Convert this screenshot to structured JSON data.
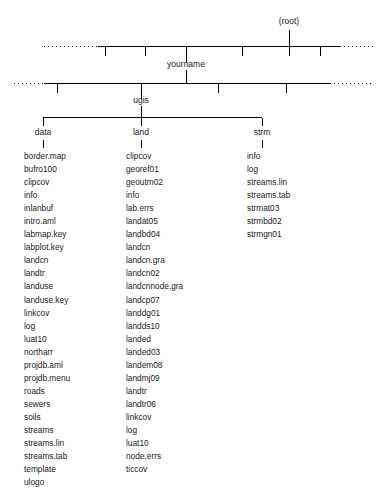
{
  "diagram": {
    "type": "directory-tree",
    "title_node": "(root)",
    "levels": [
      {
        "name": "root-level",
        "label": "(root)",
        "description": "top level bus with sibling ticks, dotted continuation at both ends"
      },
      {
        "name": "user-level",
        "label": "yourname",
        "description": "second level bus with sibling ticks, dotted continuation at both ends"
      },
      {
        "name": "project-level",
        "label": "ugis"
      }
    ],
    "root": {
      "label": "(root)"
    },
    "user": {
      "label": "yourname"
    },
    "project": {
      "label": "ugis"
    },
    "columns": [
      {
        "name": "data",
        "label": "data",
        "items": [
          "border.map",
          "bufro100",
          "clipcov",
          "info",
          "inlanbuf",
          "intro.aml",
          "labmap.key",
          "labplot.key",
          "landcn",
          "landtr",
          "landuse",
          "landuse.key",
          "linkcov",
          "log",
          "luat10",
          "northarr",
          "projdb.aml",
          "projdb.menu",
          "roads",
          "sewers",
          "soils",
          "streams",
          "streams.lin",
          "streams.tab",
          "template",
          "ulogo"
        ]
      },
      {
        "name": "land",
        "label": "land",
        "items": [
          "clipcov",
          "georef01",
          "geoutm02",
          "info",
          "lab.errs",
          "landat05",
          "landbd04",
          "landcn",
          "landcn.gra",
          "landcn02",
          "landcnnode.gra",
          "landcp07",
          "landdg01",
          "landds10",
          "landed",
          "landed03",
          "landem08",
          "landmj09",
          "landtr",
          "landtr06",
          "linkcov",
          "log",
          "luat10",
          "node.errs",
          "ticcov"
        ]
      },
      {
        "name": "strm",
        "label": "strm",
        "items": [
          "info",
          "log",
          "streams.lin",
          "streams.tab",
          "strmat03",
          "strmbd02",
          "strmgn01"
        ]
      }
    ],
    "colors": {
      "line": "#000000",
      "text": "#1a1a1a",
      "background": "#ffffff"
    }
  }
}
